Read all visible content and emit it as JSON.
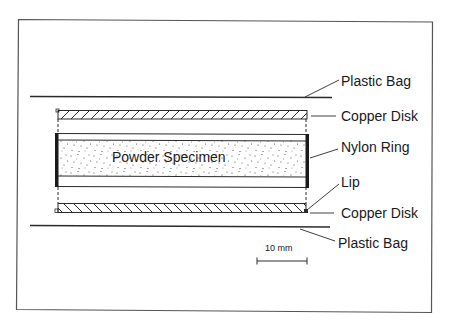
{
  "diagram": {
    "type": "cross-section schematic",
    "labels": {
      "plastic_bag_top": "Plastic Bag",
      "copper_disk_top": "Copper Disk",
      "nylon_ring": "Nylon Ring",
      "lip": "Lip",
      "copper_disk_bottom": "Copper Disk",
      "plastic_bag_bottom": "Plastic Bag",
      "specimen": "Powder Specimen"
    },
    "scale_bar": {
      "label": "10 mm"
    },
    "colors": {
      "line": "#2a2a2a",
      "frame": "#555555",
      "background": "#ffffff"
    },
    "layers": [
      {
        "name": "Plastic Bag",
        "position": "top"
      },
      {
        "name": "Copper Disk",
        "position": "top",
        "hatch": "forward-slash"
      },
      {
        "name": "Nylon Ring",
        "contains": "Powder Specimen"
      },
      {
        "name": "Copper Disk",
        "position": "bottom",
        "hatch": "back-slash",
        "feature": "Lip"
      },
      {
        "name": "Plastic Bag",
        "position": "bottom"
      }
    ]
  }
}
